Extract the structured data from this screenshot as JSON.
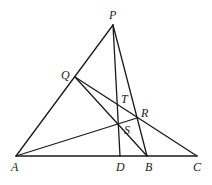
{
  "diagram": {
    "type": "geometry",
    "points": {
      "P": {
        "label": "P",
        "x": 113,
        "y": 25,
        "lx": 109,
        "ly": 19
      },
      "Q": {
        "label": "Q",
        "x": 75,
        "y": 77,
        "lx": 61,
        "ly": 79
      },
      "T": {
        "label": "T",
        "x": 118,
        "y": 105,
        "lx": 121,
        "ly": 103
      },
      "R": {
        "label": "R",
        "x": 137,
        "y": 118,
        "lx": 141,
        "ly": 117
      },
      "S": {
        "label": "S",
        "x": 118,
        "y": 124,
        "lx": 124,
        "ly": 134
      },
      "A": {
        "label": "A",
        "x": 16,
        "y": 156,
        "lx": 11,
        "ly": 171
      },
      "D": {
        "label": "D",
        "x": 120,
        "y": 156,
        "lx": 116,
        "ly": 171
      },
      "B": {
        "label": "B",
        "x": 147,
        "y": 156,
        "lx": 145,
        "ly": 171
      },
      "C": {
        "label": "C",
        "x": 197,
        "y": 156,
        "lx": 193,
        "ly": 171
      }
    },
    "segments": [
      {
        "from": "A",
        "to": "P"
      },
      {
        "from": "P",
        "to": "D"
      },
      {
        "from": "P",
        "to": "B"
      },
      {
        "from": "A",
        "to": "C"
      },
      {
        "from": "Q",
        "to": "C"
      },
      {
        "from": "Q",
        "to": "B"
      },
      {
        "from": "A",
        "to": "R"
      }
    ],
    "stroke_color": "#1a1a1a"
  }
}
